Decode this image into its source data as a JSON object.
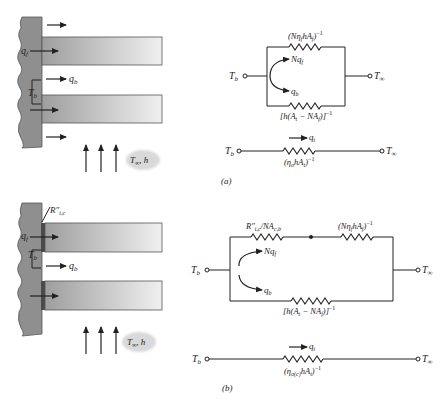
{
  "figure": {
    "panel_a": {
      "caption": "(a)",
      "fin_array": {
        "labels": {
          "q_f": "q",
          "q_f_sub": "f",
          "q_b": "q",
          "q_b_sub": "b",
          "T_b": "T",
          "T_b_sub": "b",
          "fluid": "T",
          "fluid_sub": "∞",
          "fluid_h": ", h"
        }
      },
      "parallel_network": {
        "T_b": "T",
        "T_b_sub": "b",
        "T_inf": "T",
        "T_inf_sub": "∞",
        "top_resistor_label": "(Nη",
        "top_resistor_label_sub1": "f",
        "top_resistor_label_mid": "hA",
        "top_resistor_label_sub2": "f",
        "top_resistor_label_end": ")",
        "exp": "−1",
        "bottom_resistor_label": "[h(A",
        "bottom_resistor_label_sub1": "t",
        "bottom_resistor_label_mid": " − NA",
        "bottom_resistor_label_sub2": "f",
        "bottom_resistor_label_end": ")]",
        "Nq_f": "Nq",
        "Nq_f_sub": "f",
        "q_b": "q",
        "q_b_sub": "b"
      },
      "series_network": {
        "T_b": "T",
        "T_b_sub": "b",
        "T_inf": "T",
        "T_inf_sub": "∞",
        "q_t": "q",
        "q_t_sub": "t",
        "resistor_label": "(η",
        "resistor_label_sub1": "o",
        "resistor_label_mid": "hA",
        "resistor_label_sub2": "t",
        "resistor_label_end": ")",
        "exp": "−1"
      }
    },
    "panel_b": {
      "caption": "(b)",
      "fin_array": {
        "labels": {
          "R_tc": "R″",
          "R_tc_sub": "t,c",
          "q_f": "q",
          "q_f_sub": "f",
          "q_b": "q",
          "q_b_sub": "b",
          "T_b": "T",
          "T_b_sub": "b",
          "fluid": "T",
          "fluid_sub": "∞",
          "fluid_h": ", h"
        }
      },
      "parallel_network": {
        "T_b": "T",
        "T_b_sub": "b",
        "T_inf": "T",
        "T_inf_sub": "∞",
        "contact_resistor_label": "R″",
        "contact_resistor_label_sub1": "t,c",
        "contact_resistor_label_mid": "/NA",
        "contact_resistor_label_sub2": "c,b",
        "top_resistor_label": "(Nη",
        "top_resistor_label_sub1": "f",
        "top_resistor_label_mid": "hA",
        "top_resistor_label_sub2": "f",
        "top_resistor_label_end": ")",
        "exp": "−1",
        "bottom_resistor_label": "[h(A",
        "bottom_resistor_label_sub1": "t",
        "bottom_resistor_label_mid": " − NA",
        "bottom_resistor_label_sub2": "f",
        "bottom_resistor_label_end": ")]",
        "Nq_f": "Nq",
        "Nq_f_sub": "f",
        "q_b": "q",
        "q_b_sub": "b"
      },
      "series_network": {
        "T_b": "T",
        "T_b_sub": "b",
        "T_inf": "T",
        "T_inf_sub": "∞",
        "q_t": "q",
        "q_t_sub": "t",
        "resistor_label": "(η",
        "resistor_label_sub1": "o(c)",
        "resistor_label_mid": "hA",
        "resistor_label_sub2": "t",
        "resistor_label_end": ")",
        "exp": "−1"
      }
    },
    "colors": {
      "wall": "#8f8f8f",
      "fin_dark": "#a8a8a8",
      "fin_light": "#ededed",
      "contact": "#4a4a4a",
      "line": "#222222",
      "cloud": "#d9d9d9"
    }
  }
}
